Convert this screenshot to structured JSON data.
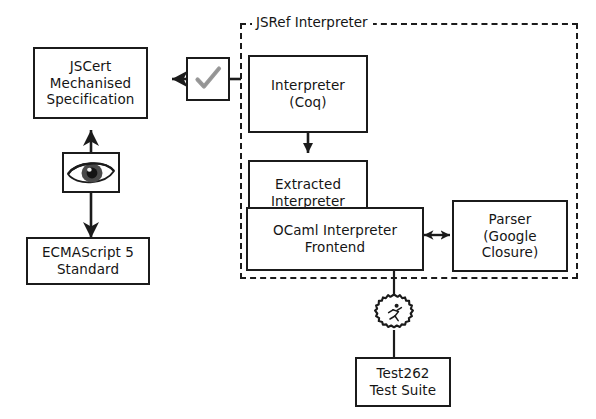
{
  "diagram": {
    "background": "#ffffff",
    "line_color": "#1b1b1b",
    "check_color": "#9a9a9a",
    "width": 596,
    "height": 419
  },
  "group": {
    "label": "JSRef Interpreter",
    "style": "dashed"
  },
  "nodes": {
    "jscert": {
      "label": "JSCert\nMechanised\nSpecification"
    },
    "ecmascript": {
      "label": "ECMAScript 5\nStandard"
    },
    "interpreter_coq": {
      "label": "Interpreter\n(Coq)"
    },
    "extracted_interpreter": {
      "label": "Extracted\nInterpreter\n(OCaml)"
    },
    "ocaml_frontend": {
      "label": "OCaml Interpreter\nFrontend"
    },
    "parser": {
      "label": "Parser\n(Google\nClosure)"
    },
    "test262": {
      "label": "Test262\nTest Suite"
    }
  },
  "icons": {
    "check": {
      "name": "check-mark-icon",
      "glyph": "✓"
    },
    "eye": {
      "name": "eye-icon",
      "glyph": "👁"
    },
    "runner": {
      "name": "running-person-gear-icon",
      "glyph": "🏃"
    }
  },
  "connectors": [
    {
      "from": "interpreter_coq",
      "to": "jscert",
      "via": "check",
      "style": "solid",
      "arrows": "single"
    },
    {
      "from": "jscert",
      "to": "ecmascript",
      "via": "eye",
      "style": "solid",
      "arrows": "double"
    },
    {
      "from": "interpreter_coq",
      "to": "extracted_interpreter",
      "style": "solid",
      "arrows": "single"
    },
    {
      "from": "ocaml_frontend",
      "to": "parser",
      "style": "solid",
      "arrows": "double"
    },
    {
      "from": "ocaml_frontend",
      "to": "test262",
      "via": "runner",
      "style": "solid",
      "arrows": "none"
    }
  ]
}
